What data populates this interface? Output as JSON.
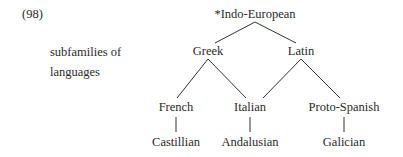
{
  "example_number": "(98)",
  "label": {
    "line1": "subfamilies of",
    "line2": "languages"
  },
  "tree": {
    "root": "*Indo-European",
    "level1": [
      "Greek",
      "Latin"
    ],
    "level2": [
      "French",
      "Italian",
      "Proto-Spanish"
    ],
    "level3": [
      "Castillian",
      "Andalusian",
      "Galician"
    ]
  }
}
